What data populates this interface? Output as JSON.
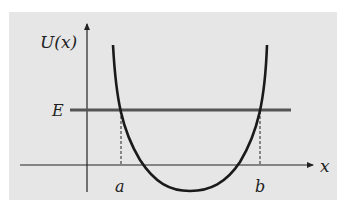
{
  "diagram": {
    "type": "potential-well",
    "y_axis_label": "U(x)",
    "x_axis_label": "x",
    "energy_label": "E",
    "turning_points": [
      "a",
      "b"
    ],
    "colors": {
      "background": "#e6e6e6",
      "curve": "#1a1a1a",
      "energy_line": "#555555",
      "axes": "#222222"
    }
  }
}
